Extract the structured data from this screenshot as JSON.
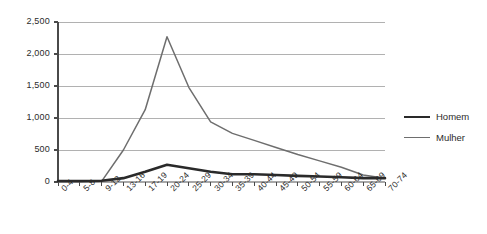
{
  "chart_data": {
    "type": "line",
    "title": "",
    "subtitle": "",
    "xlabel": "",
    "ylabel": "",
    "categories": [
      "0-4",
      "5-8",
      "9-12",
      "13-16",
      "17-19",
      "20-24",
      "25-29",
      "30-34",
      "35-39",
      "40-44",
      "45-49",
      "50-54",
      "55-59",
      "60-64",
      "65-69",
      "70-74"
    ],
    "series": [
      {
        "name": "Homem",
        "color": "#2a2a2a",
        "line_width": 2.6,
        "values": [
          15,
          15,
          20,
          60,
          160,
          270,
          215,
          160,
          120,
          120,
          110,
          95,
          85,
          75,
          60,
          60
        ]
      },
      {
        "name": "Mulher",
        "color": "#6e6e6e",
        "line_width": 1.5,
        "values": [
          5,
          5,
          10,
          500,
          1130,
          2270,
          1480,
          940,
          760,
          650,
          540,
          430,
          330,
          230,
          110,
          60
        ]
      }
    ],
    "ylim": [
      0,
      2500
    ],
    "yticks": [
      0,
      500,
      1000,
      1500,
      2000,
      2500
    ],
    "ytick_labels": [
      "0",
      "500",
      "1,000",
      "1,500",
      "2,000",
      "2,500"
    ],
    "grid": true,
    "grid_axis": "y",
    "grid_color": "#a8a8a8",
    "axis_color": "#4a4a4a",
    "legend_position": "right",
    "legend": [
      "Homem",
      "Mulher"
    ]
  }
}
